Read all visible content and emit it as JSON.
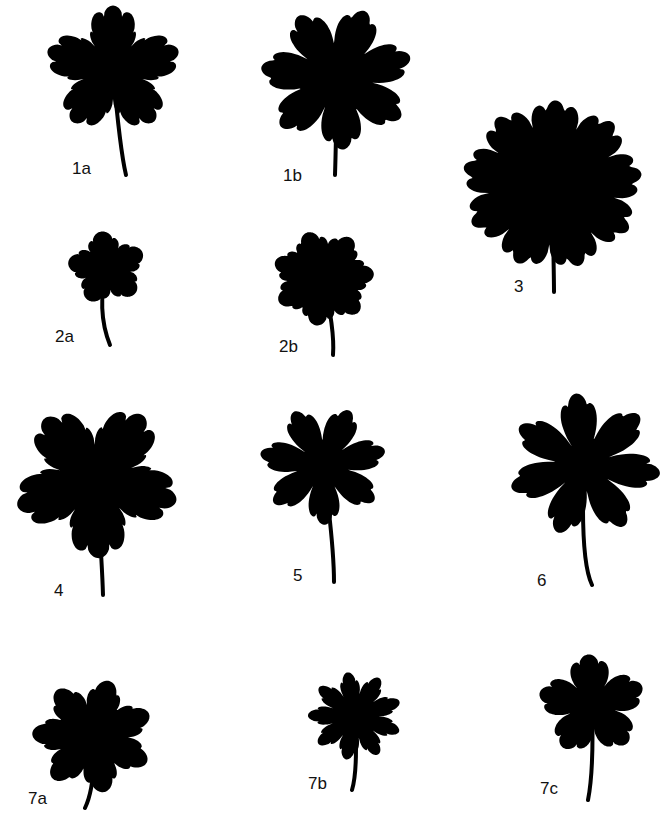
{
  "figure": {
    "background": "#ffffff",
    "ink": "#000000",
    "leaves": [
      {
        "id": "1a",
        "label": "1a",
        "cx": 113,
        "cy": 70,
        "r": 70,
        "lobes": 5,
        "teeth": 4,
        "depth": 0.55,
        "stem": [
          [
            115,
            115
          ],
          [
            120,
            150
          ],
          [
            126,
            175
          ]
        ],
        "label_x": 72,
        "label_y": 160,
        "fill": "dissected"
      },
      {
        "id": "1b",
        "label": "1b",
        "cx": 337,
        "cy": 78,
        "r": 78,
        "lobes": 7,
        "teeth": 3,
        "depth": 0.5,
        "stem": [
          [
            337,
            110
          ],
          [
            336,
            145
          ],
          [
            335,
            175
          ]
        ],
        "label_x": 283,
        "label_y": 167,
        "fill": "dissected"
      },
      {
        "id": "3",
        "label": "3",
        "cx": 552,
        "cy": 185,
        "r": 92,
        "lobes": 9,
        "teeth": 3,
        "depth": 0.18,
        "stem": [
          [
            554,
            260
          ],
          [
            554,
            275
          ],
          [
            554,
            292
          ]
        ],
        "label_x": 514,
        "label_y": 278,
        "fill": "round"
      },
      {
        "id": "2a",
        "label": "2a",
        "cx": 107,
        "cy": 268,
        "r": 40,
        "lobes": 5,
        "teeth": 2,
        "depth": 0.4,
        "stem": [
          [
            102,
            285
          ],
          [
            96,
            310
          ],
          [
            110,
            345
          ]
        ],
        "label_x": 55,
        "label_y": 328,
        "fill": "lobed"
      },
      {
        "id": "2b",
        "label": "2b",
        "cx": 323,
        "cy": 278,
        "r": 52,
        "lobes": 7,
        "teeth": 2,
        "depth": 0.3,
        "stem": [
          [
            337,
            310
          ],
          [
            335,
            330
          ],
          [
            333,
            355
          ]
        ],
        "label_x": 279,
        "label_y": 338,
        "fill": "lobed"
      },
      {
        "id": "4",
        "label": "4",
        "cx": 96,
        "cy": 480,
        "r": 85,
        "lobes": 5,
        "teeth": 4,
        "depth": 0.55,
        "stem": [
          [
            101,
            510
          ],
          [
            102,
            560
          ],
          [
            103,
            595
          ]
        ],
        "label_x": 54,
        "label_y": 582,
        "fill": "dissected"
      },
      {
        "id": "5",
        "label": "5",
        "cx": 323,
        "cy": 465,
        "r": 65,
        "lobes": 7,
        "teeth": 3,
        "depth": 0.6,
        "stem": [
          [
            333,
            500
          ],
          [
            334,
            545
          ],
          [
            334,
            582
          ]
        ],
        "label_x": 293,
        "label_y": 567,
        "fill": "dissected"
      },
      {
        "id": "6",
        "label": "6",
        "cx": 584,
        "cy": 465,
        "r": 78,
        "lobes": 7,
        "teeth": 3,
        "depth": 0.65,
        "stem": [
          [
            582,
            530
          ],
          [
            580,
            560
          ],
          [
            592,
            585
          ]
        ],
        "label_x": 537,
        "label_y": 572,
        "fill": "dissected"
      },
      {
        "id": "7a",
        "label": "7a",
        "cx": 93,
        "cy": 736,
        "r": 62,
        "lobes": 7,
        "teeth": 2,
        "depth": 0.45,
        "stem": [
          [
            98,
            760
          ],
          [
            96,
            785
          ],
          [
            85,
            808
          ]
        ],
        "label_x": 28,
        "label_y": 790,
        "fill": "lobed"
      },
      {
        "id": "7b",
        "label": "7b",
        "cx": 355,
        "cy": 716,
        "r": 48,
        "lobes": 9,
        "teeth": 2,
        "depth": 0.5,
        "stem": [
          [
            362,
            745
          ],
          [
            358,
            770
          ],
          [
            352,
            790
          ]
        ],
        "label_x": 308,
        "label_y": 775,
        "fill": "lobed"
      },
      {
        "id": "7c",
        "label": "7c",
        "cx": 592,
        "cy": 705,
        "r": 55,
        "lobes": 5,
        "teeth": 3,
        "depth": 0.5,
        "stem": [
          [
            598,
            735
          ],
          [
            594,
            770
          ],
          [
            588,
            800
          ]
        ],
        "label_x": 540,
        "label_y": 780,
        "fill": "lobed"
      }
    ]
  }
}
